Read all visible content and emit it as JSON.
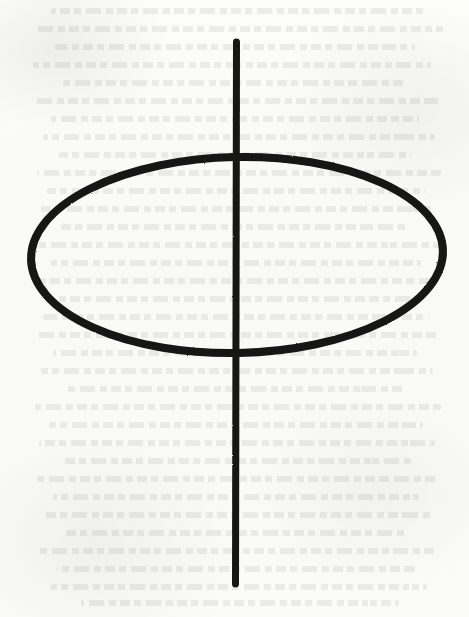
{
  "page": {
    "kind": "scanned-book-page",
    "width": 469,
    "height": 617,
    "background_color": "#fbfbfa",
    "ink_color": "#141414",
    "caption": "",
    "visible_text": ""
  },
  "figure": {
    "name": "hand-drawn-ellipse-with-vertical-axis",
    "ink_color": "#141414",
    "ellipse": {
      "center_x": 237,
      "center_y": 255,
      "radius_x": 206,
      "radius_y": 98,
      "stroke_width": 8,
      "rotation_deg": -1.2
    },
    "vertical_line": {
      "x": 236,
      "y_top": 42,
      "y_bottom": 584,
      "stroke_width": 7,
      "cap": "round"
    }
  },
  "bleedthrough": {
    "visible": true,
    "opacity_percent": 8,
    "note": "faint mirrored show-through of printed text lines from the reverse side of the sheet",
    "lines": [
      {
        "top": 8,
        "left": 46,
        "width": 372
      },
      {
        "top": 26,
        "left": 24,
        "width": 410
      },
      {
        "top": 44,
        "left": 54,
        "width": 360
      },
      {
        "top": 62,
        "left": 38,
        "width": 398
      },
      {
        "top": 80,
        "left": 62,
        "width": 344
      },
      {
        "top": 98,
        "left": 30,
        "width": 406
      },
      {
        "top": 116,
        "left": 50,
        "width": 368
      },
      {
        "top": 134,
        "left": 34,
        "width": 392
      },
      {
        "top": 152,
        "left": 58,
        "width": 352
      },
      {
        "top": 170,
        "left": 28,
        "width": 404
      },
      {
        "top": 188,
        "left": 44,
        "width": 378
      },
      {
        "top": 206,
        "left": 36,
        "width": 394
      },
      {
        "top": 224,
        "left": 60,
        "width": 348
      },
      {
        "top": 242,
        "left": 26,
        "width": 408
      },
      {
        "top": 260,
        "left": 48,
        "width": 370
      },
      {
        "top": 278,
        "left": 32,
        "width": 400
      },
      {
        "top": 296,
        "left": 56,
        "width": 356
      },
      {
        "top": 314,
        "left": 40,
        "width": 386
      },
      {
        "top": 332,
        "left": 30,
        "width": 402
      },
      {
        "top": 350,
        "left": 52,
        "width": 364
      },
      {
        "top": 368,
        "left": 36,
        "width": 392
      },
      {
        "top": 386,
        "left": 64,
        "width": 338
      },
      {
        "top": 404,
        "left": 28,
        "width": 406
      },
      {
        "top": 422,
        "left": 46,
        "width": 374
      },
      {
        "top": 440,
        "left": 34,
        "width": 396
      },
      {
        "top": 458,
        "left": 58,
        "width": 350
      },
      {
        "top": 476,
        "left": 30,
        "width": 402
      },
      {
        "top": 494,
        "left": 50,
        "width": 366
      },
      {
        "top": 512,
        "left": 38,
        "width": 388
      },
      {
        "top": 530,
        "left": 62,
        "width": 342
      },
      {
        "top": 548,
        "left": 32,
        "width": 398
      },
      {
        "top": 566,
        "left": 54,
        "width": 358
      },
      {
        "top": 584,
        "left": 42,
        "width": 376
      },
      {
        "top": 600,
        "left": 70,
        "width": 318
      }
    ]
  }
}
